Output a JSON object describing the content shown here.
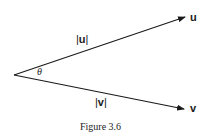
{
  "figure": {
    "caption": "Figure 3.6",
    "origin": {
      "x": 14,
      "y": 75
    },
    "vectors": [
      {
        "name": "u",
        "label": "u",
        "magnitude_label": "|u|",
        "tip": {
          "x": 186,
          "y": 17
        }
      },
      {
        "name": "v",
        "label": "v",
        "magnitude_label": "|v|",
        "tip": {
          "x": 185,
          "y": 109
        }
      }
    ],
    "angle_label": "θ"
  },
  "labels": {
    "u_bar_left": "|",
    "u_bold": "u",
    "u_bar_right": "|",
    "v_bar_left": "|",
    "v_bold": "v",
    "v_bar_right": "|",
    "u_tip": "u",
    "v_tip": "v",
    "theta": "θ",
    "caption": "Figure 3.6"
  },
  "colors": {
    "stroke": "#1a1a1a",
    "background": "#ffffff"
  }
}
